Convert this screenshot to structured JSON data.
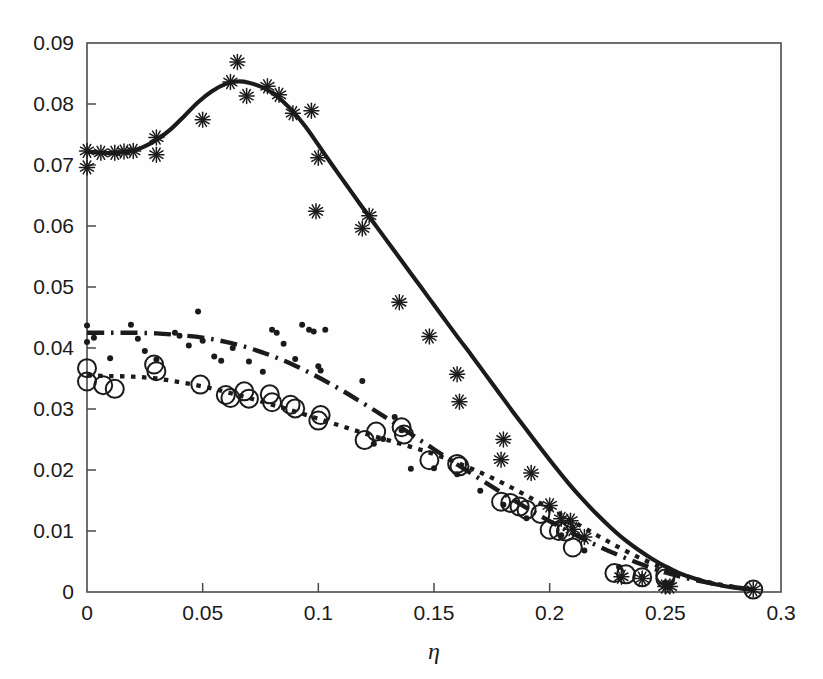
{
  "chart_data": {
    "type": "scatter",
    "title": "",
    "subtitle": "",
    "xlabel": "η",
    "ylabel": "",
    "xlim": [
      0,
      0.3
    ],
    "ylim": [
      0,
      0.09
    ],
    "grid": false,
    "legend": "none",
    "annotations": [],
    "xticks": [
      0,
      0.05,
      0.1,
      0.15,
      0.2,
      0.25,
      0.3
    ],
    "xtick_labels": [
      "0",
      "0.05",
      "0.1",
      "0.15",
      "0.2",
      "0.25",
      "0.3"
    ],
    "yticks": [
      0,
      0.01,
      0.02,
      0.03,
      0.04,
      0.05,
      0.06,
      0.07,
      0.08,
      0.09
    ],
    "ytick_labels": [
      "0",
      "0.01",
      "0.02",
      "0.03",
      "0.04",
      "0.05",
      "0.06",
      "0.07",
      "0.08",
      "0.09"
    ],
    "series": [
      {
        "name": "solid-curve",
        "style": "solid",
        "marker": "none",
        "color": "#1b1b1b",
        "points": [
          [
            0.0,
            0.0722
          ],
          [
            0.006,
            0.072
          ],
          [
            0.012,
            0.072
          ],
          [
            0.018,
            0.0722
          ],
          [
            0.024,
            0.0729
          ],
          [
            0.03,
            0.0741
          ],
          [
            0.036,
            0.0758
          ],
          [
            0.042,
            0.078
          ],
          [
            0.048,
            0.0803
          ],
          [
            0.054,
            0.0821
          ],
          [
            0.06,
            0.0833
          ],
          [
            0.065,
            0.0837
          ],
          [
            0.07,
            0.0835
          ],
          [
            0.076,
            0.0827
          ],
          [
            0.082,
            0.0813
          ],
          [
            0.088,
            0.0792
          ],
          [
            0.094,
            0.0765
          ],
          [
            0.1,
            0.0733
          ],
          [
            0.106,
            0.07
          ],
          [
            0.112,
            0.0668
          ],
          [
            0.118,
            0.0636
          ],
          [
            0.124,
            0.0605
          ],
          [
            0.13,
            0.0574
          ],
          [
            0.136,
            0.0543
          ],
          [
            0.142,
            0.0512
          ],
          [
            0.148,
            0.0481
          ],
          [
            0.154,
            0.045
          ],
          [
            0.16,
            0.0419
          ],
          [
            0.166,
            0.0389
          ],
          [
            0.172,
            0.0358
          ],
          [
            0.178,
            0.0327
          ],
          [
            0.184,
            0.0296
          ],
          [
            0.19,
            0.0266
          ],
          [
            0.196,
            0.0236
          ],
          [
            0.202,
            0.0207
          ],
          [
            0.208,
            0.0179
          ],
          [
            0.214,
            0.0153
          ],
          [
            0.22,
            0.0129
          ],
          [
            0.226,
            0.0107
          ],
          [
            0.232,
            0.0087
          ],
          [
            0.238,
            0.007
          ],
          [
            0.244,
            0.0055
          ],
          [
            0.25,
            0.0042
          ],
          [
            0.256,
            0.0031
          ],
          [
            0.262,
            0.0023
          ],
          [
            0.268,
            0.0016
          ],
          [
            0.274,
            0.0011
          ],
          [
            0.28,
            0.0007
          ],
          [
            0.288,
            0.0004
          ]
        ]
      },
      {
        "name": "dash-dot-curve",
        "style": "dashdot",
        "marker": "none",
        "color": "#1b1b1b",
        "points": [
          [
            0.0,
            0.0425
          ],
          [
            0.01,
            0.0425
          ],
          [
            0.02,
            0.0425
          ],
          [
            0.03,
            0.0424
          ],
          [
            0.04,
            0.0421
          ],
          [
            0.05,
            0.0417
          ],
          [
            0.06,
            0.041
          ],
          [
            0.07,
            0.04
          ],
          [
            0.08,
            0.0387
          ],
          [
            0.09,
            0.0371
          ],
          [
            0.1,
            0.0352
          ],
          [
            0.11,
            0.0331
          ],
          [
            0.12,
            0.0308
          ],
          [
            0.13,
            0.0284
          ],
          [
            0.14,
            0.0259
          ],
          [
            0.15,
            0.0234
          ],
          [
            0.16,
            0.0209
          ],
          [
            0.17,
            0.0185
          ],
          [
            0.18,
            0.0161
          ],
          [
            0.19,
            0.0138
          ],
          [
            0.2,
            0.0116
          ],
          [
            0.21,
            0.0096
          ],
          [
            0.22,
            0.0077
          ],
          [
            0.23,
            0.006
          ],
          [
            0.24,
            0.0045
          ],
          [
            0.25,
            0.0032
          ],
          [
            0.26,
            0.0022
          ],
          [
            0.27,
            0.0014
          ],
          [
            0.28,
            0.0008
          ],
          [
            0.288,
            0.0004
          ]
        ]
      },
      {
        "name": "dotted-curve",
        "style": "dotted",
        "marker": "none",
        "color": "#1b1b1b",
        "points": [
          [
            0.0,
            0.0355
          ],
          [
            0.01,
            0.0354
          ],
          [
            0.02,
            0.0353
          ],
          [
            0.03,
            0.035
          ],
          [
            0.04,
            0.0344
          ],
          [
            0.05,
            0.0337
          ],
          [
            0.06,
            0.0328
          ],
          [
            0.07,
            0.0318
          ],
          [
            0.08,
            0.0307
          ],
          [
            0.09,
            0.0296
          ],
          [
            0.1,
            0.0284
          ],
          [
            0.11,
            0.0272
          ],
          [
            0.12,
            0.026
          ],
          [
            0.13,
            0.0249
          ],
          [
            0.14,
            0.0238
          ],
          [
            0.15,
            0.0226
          ],
          [
            0.16,
            0.0212
          ],
          [
            0.17,
            0.0196
          ],
          [
            0.18,
            0.0178
          ],
          [
            0.19,
            0.0158
          ],
          [
            0.2,
            0.0137
          ],
          [
            0.21,
            0.0116
          ],
          [
            0.22,
            0.0094
          ],
          [
            0.23,
            0.0073
          ],
          [
            0.24,
            0.0054
          ],
          [
            0.25,
            0.0038
          ],
          [
            0.26,
            0.0025
          ],
          [
            0.27,
            0.0015
          ],
          [
            0.28,
            0.0008
          ],
          [
            0.288,
            0.0004
          ]
        ]
      },
      {
        "name": "asterisk-data",
        "style": "none",
        "marker": "asterisk",
        "color": "#1b1b1b",
        "points": [
          [
            0.0,
            0.0723
          ],
          [
            0.0,
            0.0696
          ],
          [
            0.006,
            0.072
          ],
          [
            0.012,
            0.072
          ],
          [
            0.016,
            0.0722
          ],
          [
            0.02,
            0.0723
          ],
          [
            0.03,
            0.0745
          ],
          [
            0.03,
            0.0717
          ],
          [
            0.05,
            0.0774
          ],
          [
            0.062,
            0.0836
          ],
          [
            0.065,
            0.0869
          ],
          [
            0.069,
            0.0813
          ],
          [
            0.078,
            0.0829
          ],
          [
            0.083,
            0.0815
          ],
          [
            0.089,
            0.0785
          ],
          [
            0.097,
            0.0789
          ],
          [
            0.1,
            0.0712
          ],
          [
            0.099,
            0.0624
          ],
          [
            0.119,
            0.0596
          ],
          [
            0.122,
            0.0617
          ],
          [
            0.135,
            0.0475
          ],
          [
            0.148,
            0.0419
          ],
          [
            0.16,
            0.0357
          ],
          [
            0.161,
            0.0312
          ],
          [
            0.18,
            0.025
          ],
          [
            0.179,
            0.0217
          ],
          [
            0.192,
            0.0195
          ],
          [
            0.2,
            0.0142
          ],
          [
            0.205,
            0.012
          ],
          [
            0.209,
            0.0117
          ],
          [
            0.21,
            0.0103
          ],
          [
            0.215,
            0.009
          ],
          [
            0.231,
            0.0025
          ],
          [
            0.24,
            0.0022
          ],
          [
            0.25,
            0.0009
          ],
          [
            0.252,
            0.0009
          ],
          [
            0.288,
            0.0004
          ]
        ]
      },
      {
        "name": "open-circle-data",
        "style": "none",
        "marker": "circle",
        "color": "#1b1b1b",
        "points": [
          [
            0.0,
            0.0367
          ],
          [
            0.0,
            0.0345
          ],
          [
            0.007,
            0.0339
          ],
          [
            0.012,
            0.0333
          ],
          [
            0.029,
            0.0373
          ],
          [
            0.03,
            0.0362
          ],
          [
            0.049,
            0.034
          ],
          [
            0.06,
            0.0323
          ],
          [
            0.062,
            0.0318
          ],
          [
            0.068,
            0.0329
          ],
          [
            0.07,
            0.0317
          ],
          [
            0.079,
            0.0324
          ],
          [
            0.08,
            0.0311
          ],
          [
            0.088,
            0.0307
          ],
          [
            0.09,
            0.0301
          ],
          [
            0.101,
            0.029
          ],
          [
            0.1,
            0.0281
          ],
          [
            0.12,
            0.0249
          ],
          [
            0.125,
            0.0263
          ],
          [
            0.136,
            0.027
          ],
          [
            0.137,
            0.0258
          ],
          [
            0.148,
            0.0216
          ],
          [
            0.16,
            0.021
          ],
          [
            0.161,
            0.0206
          ],
          [
            0.179,
            0.0148
          ],
          [
            0.183,
            0.0146
          ],
          [
            0.187,
            0.014
          ],
          [
            0.19,
            0.0135
          ],
          [
            0.196,
            0.0128
          ],
          [
            0.2,
            0.0102
          ],
          [
            0.204,
            0.01
          ],
          [
            0.207,
            0.0099
          ],
          [
            0.21,
            0.0073
          ],
          [
            0.228,
            0.0031
          ],
          [
            0.233,
            0.0029
          ],
          [
            0.24,
            0.0024
          ],
          [
            0.25,
            0.0028
          ],
          [
            0.25,
            0.0022
          ],
          [
            0.288,
            0.0004
          ]
        ]
      },
      {
        "name": "small-dot-data",
        "style": "none",
        "marker": "dot",
        "color": "#1b1b1b",
        "points": [
          [
            0.0,
            0.0437
          ],
          [
            0.0,
            0.041
          ],
          [
            0.003,
            0.0417
          ],
          [
            0.01,
            0.0383
          ],
          [
            0.019,
            0.0438
          ],
          [
            0.022,
            0.0415
          ],
          [
            0.025,
            0.0395
          ],
          [
            0.03,
            0.0381
          ],
          [
            0.038,
            0.0425
          ],
          [
            0.04,
            0.042
          ],
          [
            0.044,
            0.0404
          ],
          [
            0.048,
            0.046
          ],
          [
            0.05,
            0.0412
          ],
          [
            0.055,
            0.0386
          ],
          [
            0.058,
            0.0379
          ],
          [
            0.063,
            0.04
          ],
          [
            0.07,
            0.0378
          ],
          [
            0.076,
            0.0361
          ],
          [
            0.08,
            0.043
          ],
          [
            0.082,
            0.0425
          ],
          [
            0.085,
            0.0407
          ],
          [
            0.09,
            0.0382
          ],
          [
            0.093,
            0.0438
          ],
          [
            0.096,
            0.043
          ],
          [
            0.098,
            0.0427
          ],
          [
            0.1,
            0.037
          ],
          [
            0.101,
            0.0363
          ],
          [
            0.103,
            0.043
          ],
          [
            0.119,
            0.0346
          ],
          [
            0.124,
            0.0243
          ],
          [
            0.128,
            0.0251
          ],
          [
            0.133,
            0.0287
          ],
          [
            0.136,
            0.0265
          ],
          [
            0.14,
            0.0202
          ],
          [
            0.15,
            0.0203
          ],
          [
            0.16,
            0.0193
          ],
          [
            0.17,
            0.0166
          ],
          [
            0.18,
            0.0143
          ],
          [
            0.19,
            0.0121
          ],
          [
            0.205,
            0.0093
          ],
          [
            0.215,
            0.0068
          ],
          [
            0.23,
            0.0041
          ],
          [
            0.24,
            0.0025
          ],
          [
            0.25,
            0.0015
          ]
        ]
      }
    ]
  },
  "axes": {
    "frame": "box",
    "axis_color": "#4a4a4a"
  }
}
